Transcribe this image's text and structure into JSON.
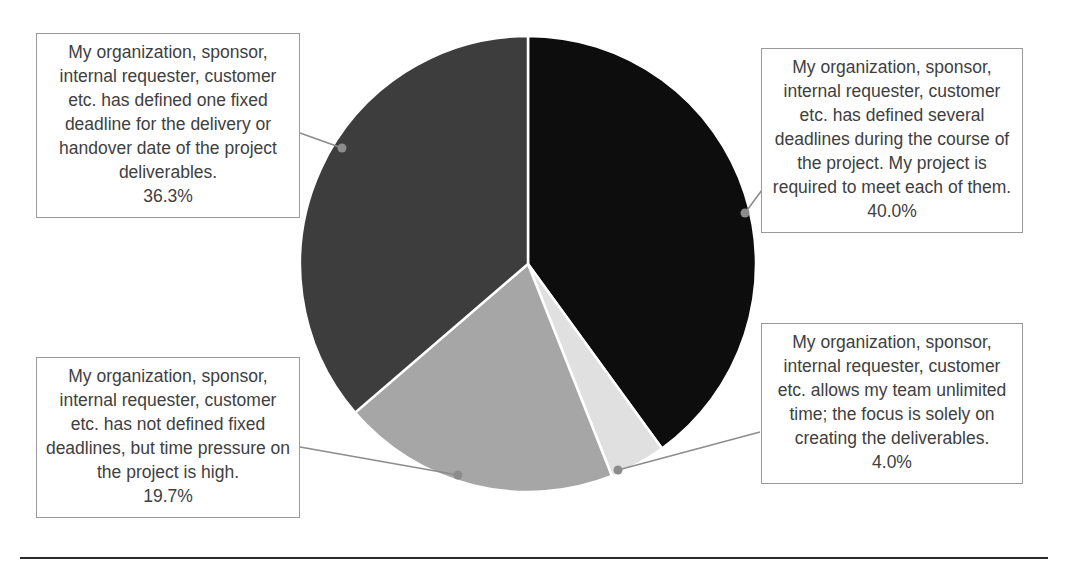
{
  "chart_data": {
    "type": "pie",
    "title": "",
    "subtitle": "",
    "xlabel": "",
    "ylabel": "",
    "legend_position": "callout-labels",
    "grid": false,
    "start_angle_deg": 0,
    "direction": "clockwise",
    "categories": [
      "My organization, sponsor, internal requester, customer etc. has defined several deadlines during the course of the project. My project is required to meet each of them.",
      "My organization, sponsor, internal requester, customer etc. allows my team unlimited time; the focus is solely on creating the deliverables.",
      "My organization, sponsor, internal requester, customer etc. has not defined fixed deadlines, but time pressure on the project is high.",
      "My organization, sponsor, internal requester, customer etc. has defined one fixed deadline for the delivery or handover date of the project deliverables."
    ],
    "values": [
      40.0,
      4.0,
      19.7,
      36.3
    ],
    "value_labels": [
      "40.0%",
      "4.0%",
      "19.7%",
      "36.3%"
    ],
    "colors": [
      "#0d0d0d",
      "#e0e0e0",
      "#a6a6a6",
      "#3d3d3d"
    ],
    "units": "percent",
    "total": 100.0
  },
  "pie": {
    "center_x": 528,
    "center_y": 264,
    "radius": 228,
    "slice_border_color": "#ffffff",
    "slice_border_width": 2.5,
    "slices": [
      {
        "name": "several-deadlines",
        "label": "40.0%",
        "value": 40.0,
        "color": "#0d0d0d",
        "start_deg": 0,
        "end_deg": 144
      },
      {
        "name": "unlimited-time",
        "label": "4.0%",
        "value": 4.0,
        "color": "#e0e0e0",
        "start_deg": 144,
        "end_deg": 158.4
      },
      {
        "name": "no-fixed-deadlines",
        "label": "19.7%",
        "value": 19.7,
        "color": "#a6a6a6",
        "start_deg": 158.4,
        "end_deg": 229.32
      },
      {
        "name": "one-fixed-deadline",
        "label": "36.3%",
        "value": 36.3,
        "color": "#3d3d3d",
        "start_deg": 229.32,
        "end_deg": 360
      }
    ]
  },
  "callouts": {
    "top_left": {
      "name": "one-fixed-deadline",
      "text": "My organization, sponsor, internal requester, customer etc. has defined one fixed deadline for the delivery or handover date of the project deliverables.",
      "percent": "36.3%"
    },
    "top_right": {
      "name": "several-deadlines",
      "text": "My organization, sponsor, internal requester, customer etc. has defined several deadlines during the course of the project. My project is required to meet each of them.",
      "percent": "40.0%"
    },
    "bottom_left": {
      "name": "no-fixed-deadlines",
      "text": "My organization, sponsor, internal requester, customer etc. has not defined fixed deadlines, but time pressure on the project is high.",
      "percent": "19.7%"
    },
    "bottom_right": {
      "name": "unlimited-time",
      "text": "My organization, sponsor, internal requester, customer etc. allows my team unlimited time; the focus is solely on creating the deliverables.",
      "percent": "4.0%"
    }
  },
  "leaders": {
    "color": "#8c8c8c",
    "dot_radius": 4.5,
    "lines": [
      {
        "name": "leader-one-fixed-deadline",
        "x1": 300,
        "y1": 133,
        "x2": 342,
        "y2": 148
      },
      {
        "name": "leader-several-deadlines",
        "x1": 762,
        "y1": 190,
        "x2": 745,
        "y2": 213
      },
      {
        "name": "leader-no-fixed-deadlines",
        "x1": 300,
        "y1": 447,
        "x2": 458,
        "y2": 475
      },
      {
        "name": "leader-unlimited-time",
        "x1": 760,
        "y1": 432,
        "x2": 618,
        "y2": 470
      }
    ]
  },
  "footer_rule": {
    "name": "bottom-divider",
    "color": "#2b2b2b"
  }
}
